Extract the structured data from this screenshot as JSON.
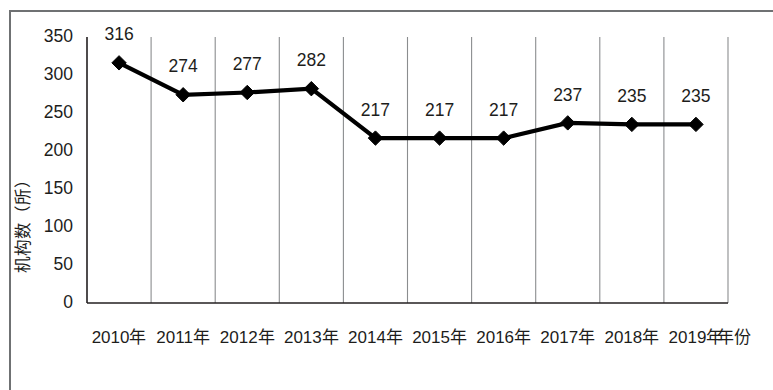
{
  "chart_data": {
    "type": "line",
    "title": "",
    "subtitle": "",
    "xlabel": "年份",
    "ylabel": "机构数（所）",
    "categories": [
      "2010年",
      "2011年",
      "2012年",
      "2013年",
      "2014年",
      "2015年",
      "2016年",
      "2017年",
      "2018年",
      "2019年"
    ],
    "values": [
      316,
      274,
      277,
      282,
      217,
      217,
      217,
      237,
      235,
      235
    ],
    "point_labels": [
      "316",
      "274",
      "277",
      "282",
      "217",
      "217",
      "217",
      "237",
      "235",
      "235"
    ],
    "series": [
      {
        "name": "机构数",
        "values": [
          316,
          274,
          277,
          282,
          217,
          217,
          217,
          237,
          235,
          235
        ],
        "marker": "diamond",
        "color": "#000000"
      }
    ],
    "ylim": [
      0,
      350
    ],
    "yticks": [
      0,
      50,
      100,
      150,
      200,
      250,
      300,
      350
    ],
    "ytick_labels": [
      "0",
      "50",
      "100",
      "150",
      "200",
      "250",
      "300",
      "350"
    ],
    "grid": "vertical-category-boundaries",
    "legend": "none",
    "legend_position": "none",
    "axis_color": "#231f20",
    "grid_color": "#8b8d8f",
    "background_color": "#ffffff"
  },
  "figure": {
    "frame_color": "#6f7173",
    "x_axis_title": "年份",
    "y_axis_title": "机构数（所）"
  }
}
